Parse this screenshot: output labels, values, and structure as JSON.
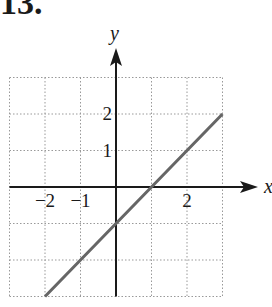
{
  "problem": {
    "number": "13."
  },
  "chart_data": {
    "type": "line",
    "title": "",
    "xlabel": "x",
    "ylabel": "y",
    "xlim": [
      -3,
      3
    ],
    "ylim": [
      -3,
      3
    ],
    "grid": true,
    "grid_style": "dotted",
    "x_tick_labels": [
      {
        "value": -2,
        "label": "−2"
      },
      {
        "value": -1,
        "label": "−1"
      },
      {
        "value": 2,
        "label": "2"
      }
    ],
    "y_tick_labels": [
      {
        "value": 1,
        "label": "1"
      },
      {
        "value": 2,
        "label": "2"
      }
    ],
    "series": [
      {
        "name": "y = x - 1",
        "x": [
          -2,
          -1,
          0,
          1,
          2,
          3
        ],
        "y": [
          -3,
          -2,
          -1,
          0,
          1,
          2
        ],
        "color": "#666666"
      }
    ],
    "axis_color": "#1a1a1a",
    "grid_color": "#999999"
  }
}
